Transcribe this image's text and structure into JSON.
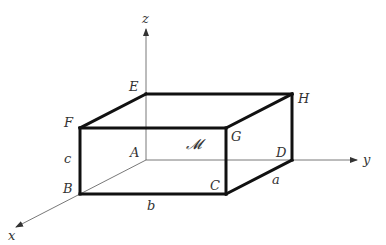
{
  "diagram": {
    "type": "rectangular-box-3d",
    "axes": [
      {
        "name": "x",
        "label": "x",
        "from": [
          146,
          160
        ],
        "to": [
          16,
          227
        ],
        "label_pos": [
          8,
          240
        ]
      },
      {
        "name": "y",
        "label": "y",
        "from": [
          146,
          160
        ],
        "to": [
          357,
          160
        ],
        "label_pos": [
          363,
          164
        ]
      },
      {
        "name": "z",
        "label": "z",
        "from": [
          146,
          160
        ],
        "to": [
          146,
          29
        ],
        "label_pos": [
          142,
          23
        ]
      }
    ],
    "vertices": {
      "A": {
        "label": "A",
        "pos": [
          146,
          160
        ],
        "label_pos": [
          130,
          157
        ]
      },
      "B": {
        "label": "B",
        "pos": [
          80,
          194
        ],
        "label_pos": [
          63,
          193
        ]
      },
      "C": {
        "label": "C",
        "pos": [
          226,
          194
        ],
        "label_pos": [
          210,
          190
        ]
      },
      "D": {
        "label": "D",
        "pos": [
          292,
          160
        ],
        "label_pos": [
          276,
          157
        ]
      },
      "E": {
        "label": "E",
        "pos": [
          146,
          94
        ],
        "label_pos": [
          129,
          91
        ]
      },
      "F": {
        "label": "F",
        "pos": [
          80,
          128
        ],
        "label_pos": [
          64,
          127
        ]
      },
      "G": {
        "label": "G",
        "pos": [
          226,
          128
        ],
        "label_pos": [
          231,
          141
        ]
      },
      "H": {
        "label": "H",
        "pos": [
          292,
          94
        ],
        "label_pos": [
          298,
          103
        ]
      }
    },
    "edges_bold": [
      "E-H",
      "F-G",
      "E-F",
      "G-H",
      "B-C",
      "F-B",
      "G-C",
      "H-D",
      "C-D"
    ],
    "edges_thin": [
      "A-B",
      "A-D",
      "A-E"
    ],
    "dimensions": {
      "a": {
        "label": "a",
        "pos": [
          272,
          184
        ]
      },
      "b": {
        "label": "b",
        "pos": [
          147,
          210
        ]
      },
      "c": {
        "label": "c",
        "pos": [
          64,
          163
        ]
      }
    },
    "region_label": {
      "label": "𝓜",
      "pos": [
        186,
        149
      ]
    }
  }
}
